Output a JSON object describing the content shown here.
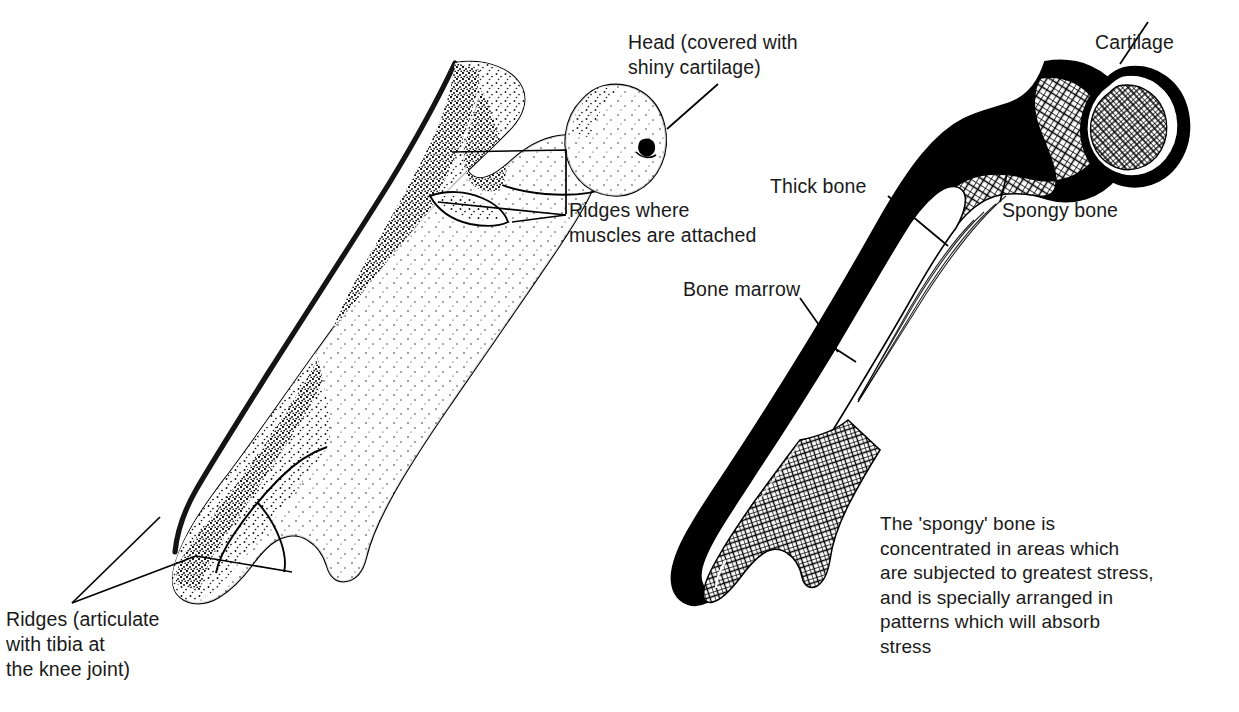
{
  "figure": {
    "ink_color": "#000000",
    "background_color": "#ffffff",
    "text_color": "#1a1a1a"
  },
  "left_diagram": {
    "name": "whole-femur-external-view",
    "labels": {
      "head": "Head (covered with\nshiny cartilage)",
      "ridges_muscles": "Ridges where\nmuscles are attached",
      "ridges_knee": "Ridges (articulate\nwith tibia at\nthe knee joint)"
    }
  },
  "right_diagram": {
    "name": "femur-longitudinal-section",
    "labels": {
      "cartilage": "Cartilage",
      "thick_bone": "Thick bone",
      "spongy_bone": "Spongy bone",
      "bone_marrow": "Bone marrow"
    },
    "note": "The 'spongy' bone is\nconcentrated in areas which\nare subjected to greatest stress,\nand is specially arranged in\npatterns which will absorb\nstress"
  }
}
